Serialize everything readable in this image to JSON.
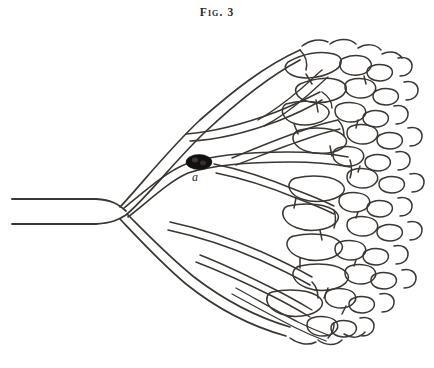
{
  "figure": {
    "caption": "Fig. 3",
    "background_color": "#ffffff",
    "ink_color": "#3a3632",
    "corpuscle_color": "#131110",
    "width": 434,
    "height": 368
  },
  "labels": [
    {
      "id": "a",
      "text": "a",
      "style": "italic",
      "x": 192,
      "y": 170,
      "describes": "dark oval body within the vessel lumen"
    }
  ],
  "structures": {
    "trunk": {
      "name": "main vessel trunk",
      "entry_side": "left",
      "entry_x": 12,
      "entry_y": 205,
      "bifurcation_x": 112,
      "bifurcation_y": 213
    },
    "branches": [
      {
        "name": "upper-branch",
        "direction": "up-right"
      },
      {
        "name": "lower-branch",
        "direction": "down-right"
      }
    ],
    "plexus": {
      "name": "capillary plexus",
      "position": "right",
      "description": "dense irregular polygonal mesh"
    }
  }
}
